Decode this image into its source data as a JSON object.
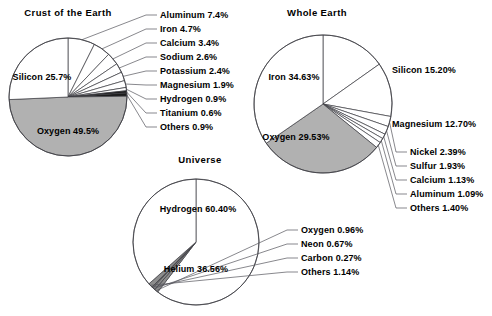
{
  "figure": {
    "background": "#ffffff",
    "width": 492,
    "height": 316,
    "fill_white": "#ffffff",
    "fill_gray": "#b1b1b1",
    "stroke": "#3c3c42",
    "leader_color": "#55555c"
  },
  "chart_data": [
    {
      "type": "pie",
      "title": "Crust of the Earth",
      "center": [
        68,
        97
      ],
      "radius": 59,
      "start_angle_deg": -90,
      "direction": "clockwise",
      "labels": [
        "Aluminum 7.4%",
        "Iron 4.7%",
        "Calcium 3.4%",
        "Sodium 2.6%",
        "Potassium 2.4%",
        "Magnesium 1.9%",
        "Hydrogen 0.9%",
        "Titanium 0.6%",
        "Others 0.9%",
        "Oxygen 49.5%",
        "Silicon 25.7%"
      ],
      "categories": [
        "Aluminum",
        "Iron",
        "Calcium",
        "Sodium",
        "Potassium",
        "Magnesium",
        "Hydrogen",
        "Titanium",
        "Others",
        "Oxygen",
        "Silicon"
      ],
      "values": [
        7.4,
        4.7,
        3.4,
        2.6,
        2.4,
        1.9,
        0.9,
        0.6,
        0.9,
        49.5,
        25.7
      ],
      "slices": [
        {
          "name": "Aluminum",
          "value": 7.4,
          "label": "Aluminum 7.4%",
          "fill": "#ffffff",
          "placement": "callout",
          "label_xy": [
            160,
            18
          ],
          "anchor": "start"
        },
        {
          "name": "Iron",
          "value": 4.7,
          "label": "Iron 4.7%",
          "fill": "#ffffff",
          "placement": "callout",
          "label_xy": [
            160,
            32
          ],
          "anchor": "start"
        },
        {
          "name": "Calcium",
          "value": 3.4,
          "label": "Calcium 3.4%",
          "fill": "#ffffff",
          "placement": "callout",
          "label_xy": [
            160,
            46
          ],
          "anchor": "start"
        },
        {
          "name": "Sodium",
          "value": 2.6,
          "label": "Sodium 2.6%",
          "fill": "#ffffff",
          "placement": "callout",
          "label_xy": [
            160,
            60
          ],
          "anchor": "start"
        },
        {
          "name": "Potassium",
          "value": 2.4,
          "label": "Potassium 2.4%",
          "fill": "#ffffff",
          "placement": "callout",
          "label_xy": [
            160,
            74
          ],
          "anchor": "start"
        },
        {
          "name": "Magnesium",
          "value": 1.9,
          "label": "Magnesium 1.9%",
          "fill": "#ffffff",
          "placement": "callout",
          "label_xy": [
            160,
            88
          ],
          "anchor": "start"
        },
        {
          "name": "Hydrogen",
          "value": 0.9,
          "label": "Hydrogen 0.9%",
          "fill": "#ffffff",
          "placement": "callout",
          "label_xy": [
            160,
            102
          ],
          "anchor": "start"
        },
        {
          "name": "Titanium",
          "value": 0.6,
          "label": "Titanium 0.6%",
          "fill": "#1c1c1c",
          "placement": "callout",
          "label_xy": [
            160,
            116
          ],
          "anchor": "start"
        },
        {
          "name": "Others",
          "value": 0.9,
          "label": "Others 0.9%",
          "fill": "#1c1c1c",
          "placement": "callout",
          "label_xy": [
            160,
            130
          ],
          "anchor": "start"
        },
        {
          "name": "Oxygen",
          "value": 49.5,
          "label": "Oxygen 49.5%",
          "fill": "#b1b1b1",
          "placement": "inside",
          "label_xy": [
            68,
            134
          ],
          "anchor": "middle"
        },
        {
          "name": "Silicon",
          "value": 25.7,
          "label": "Silicon 25.7%",
          "fill": "#ffffff",
          "placement": "inside",
          "label_xy": [
            42,
            80
          ],
          "anchor": "middle"
        }
      ],
      "title_xy": [
        68,
        16
      ]
    },
    {
      "type": "pie",
      "title": "Whole Earth",
      "center": [
        323,
        104
      ],
      "radius": 69,
      "start_angle_deg": -90,
      "direction": "clockwise",
      "labels": [
        "Silicon 15.20%",
        "Magnesium 12.70%",
        "Nickel 2.39%",
        "Sulfur 1.93%",
        "Calcium 1.13%",
        "Aluminum 1.09%",
        "Others 1.40%",
        "Oxygen 29.53%",
        "Iron 34.63%"
      ],
      "categories": [
        "Silicon",
        "Magnesium",
        "Nickel",
        "Sulfur",
        "Calcium",
        "Aluminum",
        "Others",
        "Oxygen",
        "Iron"
      ],
      "values": [
        15.2,
        12.7,
        2.39,
        1.93,
        1.13,
        1.09,
        1.4,
        29.53,
        34.63
      ],
      "slices": [
        {
          "name": "Silicon",
          "value": 15.2,
          "label": "Silicon 15.20%",
          "fill": "#ffffff",
          "placement": "outside",
          "label_xy": [
            392,
            73
          ],
          "anchor": "start"
        },
        {
          "name": "Magnesium",
          "value": 12.7,
          "label": "Magnesium 12.70%",
          "fill": "#ffffff",
          "placement": "outside",
          "label_xy": [
            392,
            127
          ],
          "anchor": "start"
        },
        {
          "name": "Nickel",
          "value": 2.39,
          "label": "Nickel 2.39%",
          "fill": "#ffffff",
          "placement": "callout",
          "label_xy": [
            410,
            155
          ],
          "anchor": "start"
        },
        {
          "name": "Sulfur",
          "value": 1.93,
          "label": "Sulfur 1.93%",
          "fill": "#ffffff",
          "placement": "callout",
          "label_xy": [
            410,
            169
          ],
          "anchor": "start"
        },
        {
          "name": "Calcium",
          "value": 1.13,
          "label": "Calcium 1.13%",
          "fill": "#ffffff",
          "placement": "callout",
          "label_xy": [
            410,
            183
          ],
          "anchor": "start"
        },
        {
          "name": "Aluminum",
          "value": 1.09,
          "label": "Aluminum 1.09%",
          "fill": "#ffffff",
          "placement": "callout",
          "label_xy": [
            410,
            197
          ],
          "anchor": "start"
        },
        {
          "name": "Others",
          "value": 1.4,
          "label": "Others 1.40%",
          "fill": "#ffffff",
          "placement": "callout",
          "label_xy": [
            410,
            211
          ],
          "anchor": "start"
        },
        {
          "name": "Oxygen",
          "value": 29.53,
          "label": "Oxygen 29.53%",
          "fill": "#b1b1b1",
          "placement": "inside",
          "label_xy": [
            296,
            140
          ],
          "anchor": "middle"
        },
        {
          "name": "Iron",
          "value": 34.63,
          "label": "Iron 34.63%",
          "fill": "#ffffff",
          "placement": "inside",
          "label_xy": [
            294,
            80
          ],
          "anchor": "middle"
        }
      ],
      "title_xy": [
        317,
        16
      ]
    },
    {
      "type": "pie",
      "title": "Universe",
      "center": [
        196,
        242
      ],
      "radius": 63,
      "start_angle_deg": -90,
      "direction": "clockwise",
      "labels": [
        "Hydrogen 60.40%",
        "Oxygen 0.96%",
        "Neon 0.67%",
        "Carbon 0.27%",
        "Others 1.14%",
        "Helium 36.56%"
      ],
      "categories": [
        "Hydrogen",
        "Oxygen",
        "Neon",
        "Carbon",
        "Others",
        "Helium"
      ],
      "values": [
        60.4,
        0.96,
        0.67,
        0.27,
        1.14,
        36.56
      ],
      "slices": [
        {
          "name": "Hydrogen",
          "value": 60.4,
          "label": "Hydrogen 60.40%",
          "fill": "#ffffff",
          "placement": "inside",
          "label_xy": [
            198,
            212
          ],
          "anchor": "middle"
        },
        {
          "name": "Oxygen",
          "value": 0.96,
          "label": "Oxygen 0.96%",
          "fill": "#8d8d8d",
          "placement": "callout",
          "label_xy": [
            301,
            233
          ],
          "anchor": "start"
        },
        {
          "name": "Neon",
          "value": 0.67,
          "label": "Neon 0.67%",
          "fill": "#8d8d8d",
          "placement": "callout",
          "label_xy": [
            301,
            247
          ],
          "anchor": "start"
        },
        {
          "name": "Carbon",
          "value": 0.27,
          "label": "Carbon 0.27%",
          "fill": "#8d8d8d",
          "placement": "callout",
          "label_xy": [
            301,
            261
          ],
          "anchor": "start"
        },
        {
          "name": "Others",
          "value": 1.14,
          "label": "Others 1.14%",
          "fill": "#8d8d8d",
          "placement": "callout",
          "label_xy": [
            301,
            275
          ],
          "anchor": "start"
        },
        {
          "name": "Helium",
          "value": 36.56,
          "label": "Helium 36.56%",
          "fill": "#ffffff",
          "placement": "inside",
          "label_xy": [
            196,
            272
          ],
          "anchor": "middle"
        }
      ],
      "title_xy": [
        200,
        163
      ]
    }
  ]
}
